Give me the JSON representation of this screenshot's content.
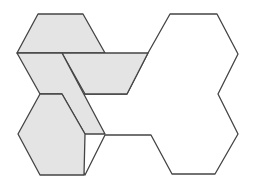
{
  "diagram": {
    "colors": {
      "fill": "#e4e4e4",
      "stroke": "#444444",
      "background": "#ffffff"
    },
    "shaded_pieces": [
      {
        "name": "top-trapezoid",
        "points": "38,14 83,14 105,53 17,53"
      },
      {
        "name": "middle-trapezoid",
        "points": "62,53 148,53 127,94 85,94"
      },
      {
        "name": "left-parallelogram",
        "points": "17,53 62,53 105,134 85,134 62,94 40,94"
      },
      {
        "name": "bottom-parallelogram",
        "points": "40,94 62,94 85,134 84,175 40,175 18,134"
      }
    ],
    "outline_shape": {
      "name": "unshaded-region",
      "points": "148,53 170,14 217,14 238,54 218,94 238,134 215,174 172,174 151,135 105,135 85,175 62,134 85,94 127,94"
    }
  }
}
